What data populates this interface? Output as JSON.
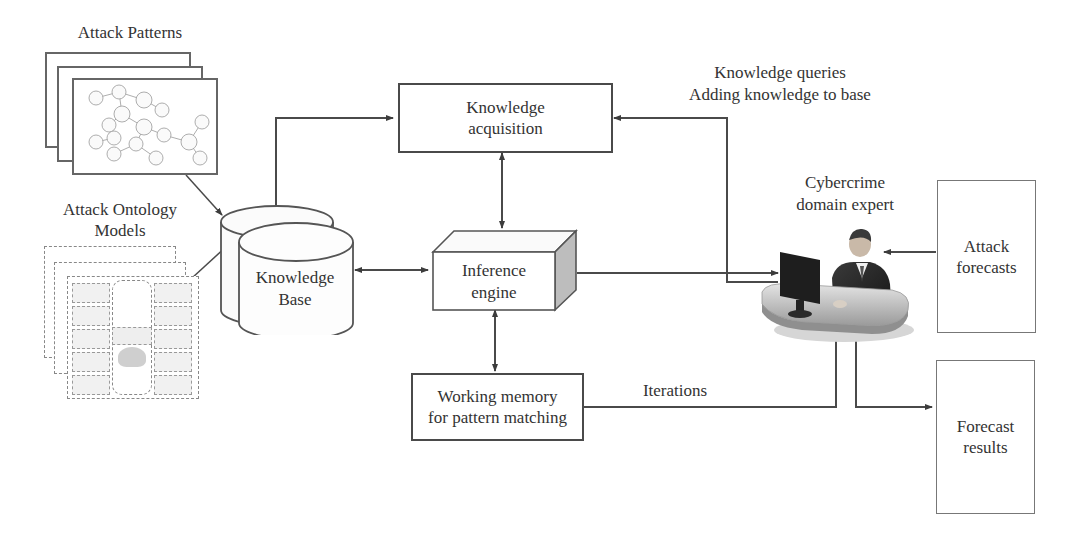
{
  "diagram": {
    "attack_patterns": {
      "title": "Attack Patterns",
      "sheet_count": 3
    },
    "attack_ontology": {
      "title_line1": "Attack Ontology",
      "title_line2": "Models",
      "sheet_count": 3,
      "center_label": "Ontology Model",
      "center_sublabel": "Bases"
    },
    "knowledge_base": {
      "line1": "Knowledge",
      "line2": "Base"
    },
    "knowledge_acquisition": {
      "line1": "Knowledge",
      "line2": "acquisition"
    },
    "inference_engine": {
      "line1": "Inference",
      "line2": "engine"
    },
    "working_memory": {
      "line1": "Working memory",
      "line2": "for pattern matching"
    },
    "queries_label": {
      "line1": "Knowledge queries",
      "line2": "Adding knowledge to base"
    },
    "expert": {
      "line1": "Cybercrime",
      "line2": "domain expert",
      "icon": "person-at-computer-icon"
    },
    "attack_forecasts": {
      "line1": "Attack",
      "line2": "forecasts"
    },
    "forecast_results": {
      "line1": "Forecast",
      "line2": "results"
    },
    "iterations_label": "Iterations"
  },
  "colors": {
    "line": "#4a4a4a",
    "fill_light": "#f4f4f4",
    "shade": "#bdbdbd",
    "text": "#333333"
  }
}
